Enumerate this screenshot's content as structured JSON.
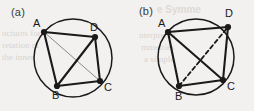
{
  "figure": {
    "background_color": "#f2f1ef",
    "width": 254,
    "height": 111,
    "ink_color": "#1a1a1a",
    "faint_ink_color": "#8a8a8a"
  },
  "panels": [
    {
      "id": "a",
      "label": "(a)",
      "circle": {
        "cx": 73,
        "cy": 58,
        "r": 39
      },
      "vertices": [
        {
          "name": "A",
          "label": "A",
          "x": 44,
          "y": 32,
          "label_x": 33,
          "label_y": 18
        },
        {
          "name": "D",
          "label": "D",
          "x": 95,
          "y": 37,
          "label_x": 90,
          "label_y": 22
        },
        {
          "name": "C",
          "label": "C",
          "x": 100,
          "y": 81,
          "label_x": 104,
          "label_y": 82
        },
        {
          "name": "B",
          "label": "B",
          "x": 57,
          "y": 86,
          "label_x": 52,
          "label_y": 90
        }
      ],
      "sides": [
        {
          "from": "A",
          "to": "D",
          "style": "solid",
          "weight": 2.1
        },
        {
          "from": "D",
          "to": "C",
          "style": "solid",
          "weight": 2.1
        },
        {
          "from": "C",
          "to": "B",
          "style": "solid",
          "weight": 2.1
        },
        {
          "from": "B",
          "to": "A",
          "style": "solid",
          "weight": 2.1
        }
      ],
      "diagonals": [
        {
          "from": "A",
          "to": "C",
          "style": "solid",
          "weight": 1.0,
          "color": "#8a8a8a"
        },
        {
          "from": "B",
          "to": "D",
          "style": "solid",
          "weight": 2.1,
          "color": "#1a1a1a"
        }
      ]
    },
    {
      "id": "b",
      "label": "(b)",
      "circle": {
        "cx": 69,
        "cy": 57,
        "r": 38
      },
      "vertices": [
        {
          "name": "A",
          "label": "A",
          "x": 41,
          "y": 32,
          "label_x": 31,
          "label_y": 18
        },
        {
          "name": "D",
          "label": "D",
          "x": 101,
          "y": 27,
          "label_x": 98,
          "label_y": 8
        },
        {
          "name": "C",
          "label": "C",
          "x": 96,
          "y": 80,
          "label_x": 100,
          "label_y": 81
        },
        {
          "name": "B",
          "label": "B",
          "x": 52,
          "y": 86,
          "label_x": 48,
          "label_y": 91
        }
      ],
      "sides": [
        {
          "from": "A",
          "to": "D",
          "style": "solid",
          "weight": 2.1
        },
        {
          "from": "D",
          "to": "C",
          "style": "solid",
          "weight": 2.1
        },
        {
          "from": "C",
          "to": "B",
          "style": "solid",
          "weight": 2.1
        },
        {
          "from": "B",
          "to": "A",
          "style": "solid",
          "weight": 2.1
        }
      ],
      "diagonals": [
        {
          "from": "A",
          "to": "C",
          "style": "solid",
          "weight": 2.1,
          "color": "#1a1a1a"
        },
        {
          "from": "B",
          "to": "D",
          "style": "dashed",
          "weight": 1.8,
          "color": "#1a1a1a"
        }
      ]
    }
  ],
  "bleed_through": [
    {
      "text": "e Symme",
      "x": 157,
      "y": 4,
      "bold": true
    },
    {
      "text": "uctures for",
      "x": 2,
      "y": 28,
      "bold": false
    },
    {
      "text": "retation of",
      "x": 2,
      "y": 40,
      "bold": false
    },
    {
      "text": "the inner",
      "x": 2,
      "y": 52,
      "bold": false
    },
    {
      "text": "nterpreted",
      "x": 139,
      "y": 30,
      "bold": false
    },
    {
      "text": "mmetries",
      "x": 141,
      "y": 42,
      "bold": false
    },
    {
      "text": "a simple",
      "x": 144,
      "y": 54,
      "bold": false
    }
  ]
}
